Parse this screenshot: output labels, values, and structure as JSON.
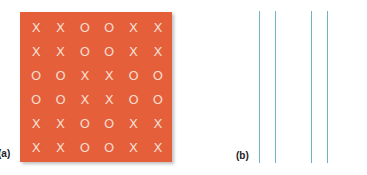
{
  "panels": {
    "a": {
      "label": "(a)",
      "background_color": "#e65f3b",
      "symbol_color": "#f6dccd",
      "grid": [
        [
          "X",
          "X",
          "O",
          "O",
          "X",
          "X"
        ],
        [
          "X",
          "X",
          "O",
          "O",
          "X",
          "X"
        ],
        [
          "O",
          "O",
          "X",
          "X",
          "O",
          "O"
        ],
        [
          "O",
          "O",
          "X",
          "X",
          "O",
          "O"
        ],
        [
          "X",
          "X",
          "O",
          "O",
          "X",
          "X"
        ],
        [
          "X",
          "X",
          "O",
          "O",
          "X",
          "X"
        ]
      ]
    },
    "b": {
      "label": "(b)",
      "line_color": "#6fb3c9",
      "line_positions_x": [
        259,
        275,
        311,
        327
      ]
    }
  }
}
